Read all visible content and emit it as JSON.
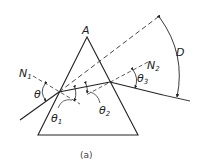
{
  "figure": {
    "caption": "(a)",
    "labels": {
      "apex": "A",
      "normal_1": "N",
      "normal_1_sub": "1",
      "normal_2": "N",
      "normal_2_sub": "2",
      "incidence_angle": "θ",
      "theta_1": "θ",
      "theta_1_sub": "1",
      "theta_2": "θ",
      "theta_2_sub": "2",
      "theta_3": "θ",
      "theta_3_sub": "3",
      "deviation": "D"
    }
  }
}
